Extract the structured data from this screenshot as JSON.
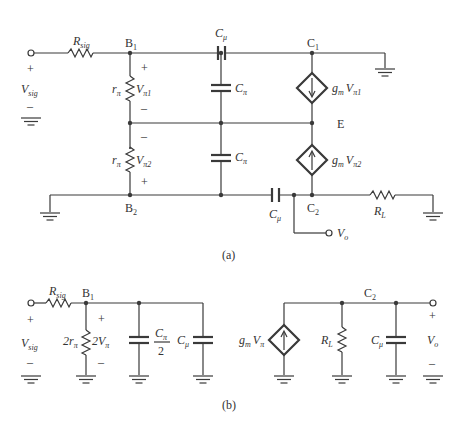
{
  "figure": {
    "panel_a": {
      "caption": "(a)",
      "nodes": {
        "b1": "B",
        "b1_sub": "1",
        "b2": "B",
        "b2_sub": "2",
        "c1": "C",
        "c1_sub": "1",
        "c2": "C",
        "c2_sub": "2",
        "e": "E"
      },
      "source": {
        "name": "V",
        "sub": "sig",
        "plus": "+",
        "minus": "–"
      },
      "rsig": {
        "name": "R",
        "sub": "sig"
      },
      "rpi1": {
        "name": "r",
        "sub": "π",
        "v": "V",
        "vsub": "π1",
        "plus": "+",
        "minus": "–"
      },
      "rpi2": {
        "name": "r",
        "sub": "π",
        "v": "V",
        "vsub": "π2",
        "plus": "+",
        "minus": "–"
      },
      "cpi1": {
        "name": "C",
        "sub": "π"
      },
      "cpi2": {
        "name": "C",
        "sub": "π"
      },
      "cmu1": {
        "name": "C",
        "sub": "μ"
      },
      "cmu2": {
        "name": "C",
        "sub": "μ"
      },
      "gm1": {
        "g": "g",
        "gsub": "m",
        "v": "V",
        "vsub": "π1",
        "direction": "down"
      },
      "gm2": {
        "g": "g",
        "gsub": "m",
        "v": "V",
        "vsub": "π2",
        "direction": "up"
      },
      "rl": {
        "name": "R",
        "sub": "L"
      },
      "vo": {
        "name": "V",
        "sub": "o"
      }
    },
    "panel_b": {
      "caption": "(b)",
      "nodes": {
        "b1": "B",
        "b1_sub": "1",
        "c2": "C",
        "c2_sub": "2"
      },
      "source": {
        "name": "V",
        "sub": "sig",
        "plus": "+",
        "minus": "–"
      },
      "rsig": {
        "name": "R",
        "sub": "sig"
      },
      "r2pi": {
        "name": "2r",
        "sub": "π",
        "v": "2V",
        "vsub": "π",
        "plus": "+",
        "minus": "–"
      },
      "cpi_half": {
        "num": "C",
        "numsub": "π",
        "den": "2"
      },
      "cmu_in": {
        "name": "C",
        "sub": "μ"
      },
      "gm": {
        "g": "g",
        "gsub": "m",
        "v": "V",
        "vsub": "π",
        "direction": "up"
      },
      "rl": {
        "name": "R",
        "sub": "L"
      },
      "cmu_out": {
        "name": "C",
        "sub": "μ"
      },
      "vo": {
        "name": "V",
        "sub": "o",
        "plus": "+",
        "minus": "–"
      }
    }
  }
}
